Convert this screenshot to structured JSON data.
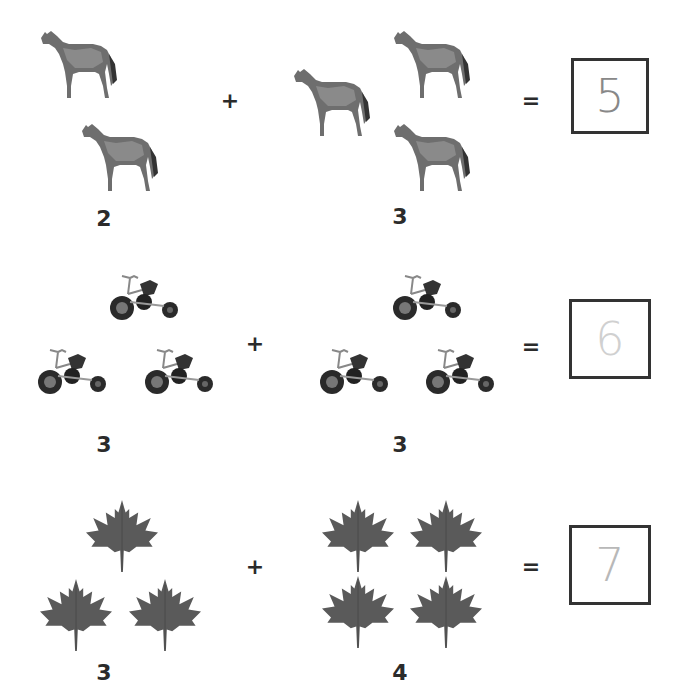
{
  "rows": [
    {
      "object": "horse",
      "left_count": "2",
      "right_count": "3",
      "operator": "+",
      "equals": "=",
      "answer": "5",
      "answer_color": "#888888"
    },
    {
      "object": "tricycle",
      "left_count": "3",
      "right_count": "3",
      "operator": "+",
      "equals": "=",
      "answer": "6",
      "answer_color": "#c8c8c8"
    },
    {
      "object": "maple-leaf",
      "left_count": "3",
      "right_count": "4",
      "operator": "+",
      "equals": "=",
      "answer": "7",
      "answer_color": "#b0b0b0"
    }
  ]
}
